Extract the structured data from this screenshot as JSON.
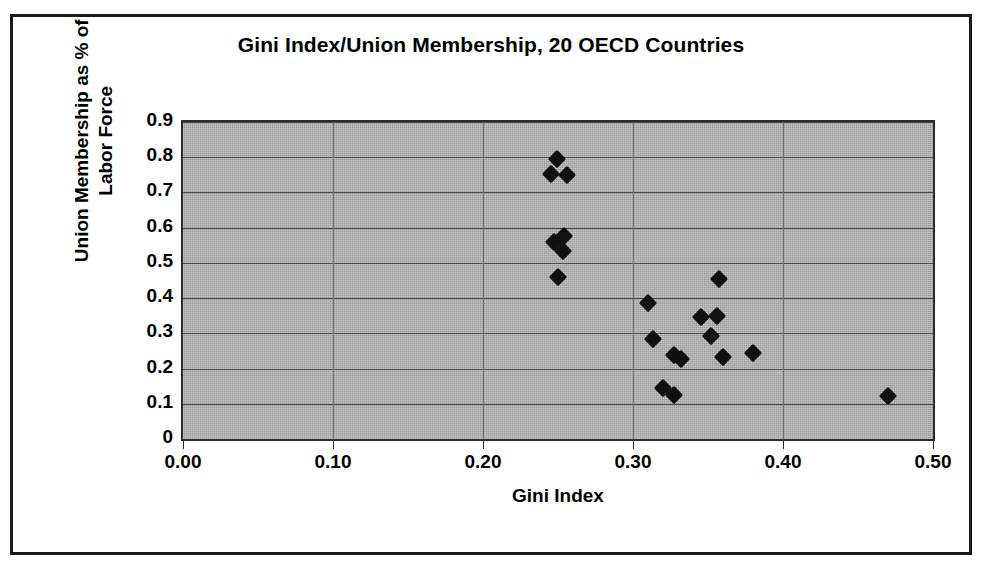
{
  "chart_data": {
    "type": "scatter",
    "title": "Gini Index/Union Membership, 20 OECD Countries",
    "xlabel": "Gini Index",
    "ylabel": "Union Membership as % of Labor Force",
    "ylabel_line1": "Union Membership as % of",
    "ylabel_line2": "Labor Force",
    "xlim": [
      0.0,
      0.5
    ],
    "ylim": [
      0.0,
      0.9
    ],
    "xticks": [
      0.0,
      0.1,
      0.2,
      0.3,
      0.4,
      0.5
    ],
    "xtick_labels": [
      "0.00",
      "0.10",
      "0.20",
      "0.30",
      "0.40",
      "0.50"
    ],
    "yticks": [
      0.0,
      0.1,
      0.2,
      0.3,
      0.4,
      0.5,
      0.6,
      0.7,
      0.8,
      0.9
    ],
    "ytick_labels": [
      "0",
      "0.1",
      "0.2",
      "0.3",
      "0.4",
      "0.5",
      "0.6",
      "0.7",
      "0.8",
      "0.9"
    ],
    "grid": "horizontal",
    "legend": "none",
    "marker": "diamond",
    "marker_color": "#101010",
    "plot_background": "#a8a8a8",
    "n_points": 21,
    "points": [
      {
        "x": 0.249,
        "y": 0.795
      },
      {
        "x": 0.245,
        "y": 0.752
      },
      {
        "x": 0.256,
        "y": 0.75
      },
      {
        "x": 0.247,
        "y": 0.56
      },
      {
        "x": 0.254,
        "y": 0.575
      },
      {
        "x": 0.253,
        "y": 0.535
      },
      {
        "x": 0.25,
        "y": 0.46
      },
      {
        "x": 0.31,
        "y": 0.385
      },
      {
        "x": 0.313,
        "y": 0.285
      },
      {
        "x": 0.32,
        "y": 0.145
      },
      {
        "x": 0.327,
        "y": 0.125
      },
      {
        "x": 0.327,
        "y": 0.238
      },
      {
        "x": 0.332,
        "y": 0.228
      },
      {
        "x": 0.345,
        "y": 0.345
      },
      {
        "x": 0.356,
        "y": 0.35
      },
      {
        "x": 0.357,
        "y": 0.455
      },
      {
        "x": 0.352,
        "y": 0.292
      },
      {
        "x": 0.36,
        "y": 0.232
      },
      {
        "x": 0.38,
        "y": 0.245
      },
      {
        "x": 0.47,
        "y": 0.122
      }
    ]
  }
}
